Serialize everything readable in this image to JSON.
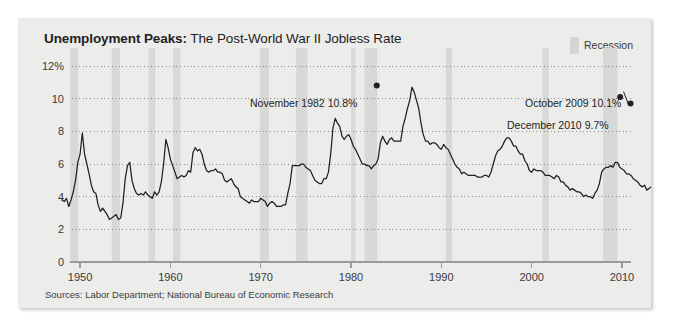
{
  "panel": {
    "title_strong": "Unemployment Peaks:",
    "title_light": " The Post-World War II Jobless Rate",
    "source": "Sources: Labor Department; National Bureau of Economic Research",
    "legend_label": "Recession",
    "legend_swatch_color": "#d5d5d4",
    "background_color": "#ececeb",
    "line_color": "#231f20"
  },
  "annotations": {
    "peak_1982": "November 1982 10.8%",
    "peak_2009": "October 2009 10.1%",
    "end_2010": "December 2010 9.7%"
  },
  "chart_data": {
    "type": "line",
    "title": "Unemployment Peaks: The Post-World War II Jobless Rate",
    "xlabel": "",
    "ylabel": "",
    "xlim": [
      1948,
      2011
    ],
    "ylim": [
      0,
      12
    ],
    "grid": true,
    "legend_position": "top-right",
    "ytick_labels": [
      "0",
      "2",
      "4",
      "6",
      "8",
      "10",
      "12%"
    ],
    "yticks": [
      0,
      2,
      4,
      6,
      8,
      10,
      12
    ],
    "xticks": [
      1950,
      1960,
      1970,
      1980,
      1990,
      2000,
      2010
    ],
    "xtick_labels": [
      "1950",
      "1960",
      "1970",
      "1980",
      "1990",
      "2000",
      "2010"
    ],
    "series": [
      {
        "name": "Unemployment rate",
        "x_start": 1948.0,
        "x_step": 0.25,
        "values": [
          3.8,
          3.7,
          3.9,
          3.4,
          3.8,
          4.3,
          5.0,
          6.1,
          6.6,
          7.9,
          6.6,
          6.0,
          5.4,
          4.7,
          4.3,
          4.2,
          3.5,
          3.1,
          3.3,
          3.1,
          2.9,
          2.6,
          2.7,
          2.8,
          2.9,
          2.6,
          2.7,
          3.6,
          5.1,
          5.9,
          6.1,
          5.0,
          4.5,
          4.2,
          4.1,
          4.2,
          4.1,
          4.3,
          4.1,
          4.0,
          3.9,
          4.3,
          4.1,
          4.3,
          4.9,
          6.0,
          7.5,
          7.0,
          6.3,
          5.9,
          5.5,
          5.1,
          5.2,
          5.3,
          5.2,
          5.3,
          5.6,
          5.5,
          6.7,
          7.0,
          6.8,
          6.9,
          6.6,
          6.0,
          5.6,
          5.5,
          5.6,
          5.6,
          5.7,
          5.5,
          5.5,
          5.4,
          5.0,
          4.9,
          5.0,
          5.1,
          4.8,
          4.6,
          4.5,
          4.0,
          3.9,
          3.8,
          3.7,
          3.6,
          3.8,
          3.7,
          3.7,
          3.7,
          3.9,
          3.8,
          3.7,
          3.4,
          3.6,
          3.7,
          3.6,
          3.4,
          3.4,
          3.4,
          3.5,
          3.5,
          4.2,
          4.8,
          5.9,
          5.9,
          5.9,
          5.9,
          6.0,
          6.0,
          5.8,
          5.7,
          5.6,
          5.3,
          5.0,
          4.9,
          4.8,
          4.8,
          5.1,
          5.1,
          5.5,
          6.6,
          8.2,
          8.8,
          8.5,
          8.3,
          7.7,
          7.5,
          7.7,
          7.8,
          7.5,
          7.1,
          6.9,
          6.6,
          6.3,
          6.0,
          6.0,
          5.9,
          5.9,
          5.7,
          5.9,
          6.0,
          6.3,
          7.3,
          7.7,
          7.4,
          7.2,
          7.5,
          7.6,
          7.4,
          7.4,
          7.4,
          7.4,
          8.3,
          8.8,
          9.4,
          9.9,
          10.7,
          10.4,
          9.9,
          9.4,
          8.5,
          7.8,
          7.4,
          7.4,
          7.2,
          7.3,
          7.3,
          7.2,
          7.0,
          6.9,
          7.2,
          7.0,
          6.9,
          6.6,
          6.3,
          6.0,
          5.8,
          5.7,
          5.4,
          5.5,
          5.4,
          5.3,
          5.3,
          5.3,
          5.3,
          5.2,
          5.2,
          5.2,
          5.3,
          5.3,
          5.2,
          5.5,
          6.0,
          6.5,
          6.8,
          6.9,
          7.1,
          7.4,
          7.6,
          7.6,
          7.4,
          7.1,
          7.1,
          6.8,
          6.6,
          6.6,
          6.2,
          6.0,
          5.6,
          5.5,
          5.7,
          5.6,
          5.6,
          5.6,
          5.5,
          5.3,
          5.3,
          5.3,
          5.2,
          5.1,
          5.3,
          5.2,
          4.9,
          4.9,
          4.7,
          4.6,
          4.4,
          4.5,
          4.4,
          4.3,
          4.3,
          4.2,
          4.0,
          4.1,
          4.0,
          4.0,
          3.9,
          4.2,
          4.4,
          4.8,
          5.5,
          5.7,
          5.8,
          5.8,
          5.9,
          5.8,
          6.1,
          6.1,
          5.8,
          5.7,
          5.6,
          5.4,
          5.4,
          5.3,
          5.1,
          5.0,
          4.9,
          4.7,
          4.6,
          4.7,
          4.4,
          4.5,
          4.6,
          4.7,
          4.8,
          5.0,
          5.4,
          6.1,
          6.9,
          8.2,
          9.3,
          9.6,
          10.0,
          9.8,
          9.7,
          9.6,
          9.7
        ],
        "color": "#231f20"
      }
    ],
    "markers": [
      {
        "label": "November 1982 10.8%",
        "x": 1982.85,
        "y": 10.8
      },
      {
        "label": "October 2009 10.1%",
        "x": 2009.8,
        "y": 10.1
      },
      {
        "label": "December 2010 9.7%",
        "x": 2010.95,
        "y": 9.7
      }
    ],
    "recession_bands": [
      {
        "start": 1948.9,
        "end": 1949.8
      },
      {
        "start": 1953.5,
        "end": 1954.4
      },
      {
        "start": 1957.6,
        "end": 1958.3
      },
      {
        "start": 1960.3,
        "end": 1961.1
      },
      {
        "start": 1969.9,
        "end": 1970.9
      },
      {
        "start": 1973.9,
        "end": 1975.2
      },
      {
        "start": 1980.0,
        "end": 1980.5
      },
      {
        "start": 1981.5,
        "end": 1982.9
      },
      {
        "start": 1990.5,
        "end": 1991.2
      },
      {
        "start": 2001.2,
        "end": 2001.9
      },
      {
        "start": 2007.9,
        "end": 2009.5
      }
    ],
    "band_color": "#d8d8d7"
  }
}
